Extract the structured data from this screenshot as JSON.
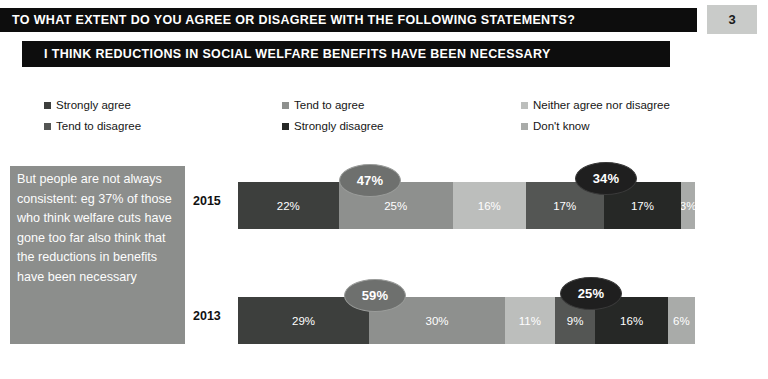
{
  "header": {
    "title": "TO WHAT EXTENT DO YOU AGREE OR DISAGREE WITH THE FOLLOWING STATEMENTS?",
    "subtitle": "I THINK REDUCTIONS IN SOCIAL WELFARE BENEFITS HAVE BEEN NECESSARY",
    "page_number": "3"
  },
  "quote": {
    "text": "But people are not always consistent: eg 37% of those who think welfare cuts have gone too far also think that the reductions in benefits have been necessary"
  },
  "legend": {
    "items": [
      {
        "label": "Strongly agree",
        "color": "#3d3f3d"
      },
      {
        "label": "Tend to disagree",
        "color": "#545654"
      },
      {
        "label": "Tend to agree",
        "color": "#8e908e"
      },
      {
        "label": "Strongly disagree",
        "color": "#262826"
      },
      {
        "label": "Neither agree nor disagree",
        "color": "#bcbebc"
      },
      {
        "label": "Don't know",
        "color": "#a9aba9"
      }
    ]
  },
  "chart_data": {
    "type": "bar",
    "orientation": "horizontal",
    "stacked": true,
    "title": "I THINK REDUCTIONS IN SOCIAL WELFARE BENEFITS HAVE BEEN NECESSARY",
    "xlabel": "",
    "ylabel": "",
    "xlim": [
      0,
      100
    ],
    "grid": false,
    "legend_position": "top",
    "categories": [
      "2015",
      "2013"
    ],
    "series": [
      {
        "name": "Strongly agree",
        "color": "#3d3f3d",
        "values": [
          22,
          29
        ]
      },
      {
        "name": "Tend to agree",
        "color": "#8e908e",
        "values": [
          25,
          30
        ]
      },
      {
        "name": "Neither agree nor disagree",
        "color": "#bcbebc",
        "values": [
          16,
          11
        ]
      },
      {
        "name": "Tend to disagree",
        "color": "#545654",
        "values": [
          17,
          9
        ]
      },
      {
        "name": "Strongly disagree",
        "color": "#262826",
        "values": [
          17,
          16
        ]
      },
      {
        "name": "Don't know",
        "color": "#a9aba9",
        "values": [
          3,
          6
        ]
      }
    ],
    "rows": [
      {
        "year": "2015",
        "segments": [
          {
            "name": "Strongly agree",
            "value": 22,
            "label": "22%",
            "color": "#3d3f3d"
          },
          {
            "name": "Tend to agree",
            "value": 25,
            "label": "25%",
            "color": "#8e908e"
          },
          {
            "name": "Neither agree nor disagree",
            "value": 16,
            "label": "16%",
            "color": "#bcbebc"
          },
          {
            "name": "Tend to disagree",
            "value": 17,
            "label": "17%",
            "color": "#545654"
          },
          {
            "name": "Strongly disagree",
            "value": 17,
            "label": "17%",
            "color": "#262826"
          },
          {
            "name": "Don't know",
            "value": 3,
            "label": "3%",
            "color": "#a9aba9"
          }
        ],
        "callouts": [
          {
            "name": "net-agree",
            "label": "47%",
            "style": "mid"
          },
          {
            "name": "net-disagree",
            "label": "34%",
            "style": "dark"
          }
        ]
      },
      {
        "year": "2013",
        "segments": [
          {
            "name": "Strongly agree",
            "value": 29,
            "label": "29%",
            "color": "#3d3f3d"
          },
          {
            "name": "Tend to agree",
            "value": 30,
            "label": "30%",
            "color": "#8e908e"
          },
          {
            "name": "Neither agree nor disagree",
            "value": 11,
            "label": "11%",
            "color": "#bcbebc"
          },
          {
            "name": "Tend to disagree",
            "value": 9,
            "label": "9%",
            "color": "#545654"
          },
          {
            "name": "Strongly disagree",
            "value": 16,
            "label": "16%",
            "color": "#262826"
          },
          {
            "name": "Don't know",
            "value": 6,
            "label": "6%",
            "color": "#a9aba9"
          }
        ],
        "callouts": [
          {
            "name": "net-agree",
            "label": "59%",
            "style": "mid"
          },
          {
            "name": "net-disagree",
            "label": "25%",
            "style": "dark"
          }
        ]
      }
    ],
    "annotations": [
      {
        "row": "2015",
        "name": "net-agree",
        "value": 47,
        "label": "47%"
      },
      {
        "row": "2015",
        "name": "net-disagree",
        "value": 34,
        "label": "34%"
      },
      {
        "row": "2013",
        "name": "net-agree",
        "value": 59,
        "label": "59%"
      },
      {
        "row": "2013",
        "name": "net-disagree",
        "value": 25,
        "label": "25%"
      }
    ]
  }
}
